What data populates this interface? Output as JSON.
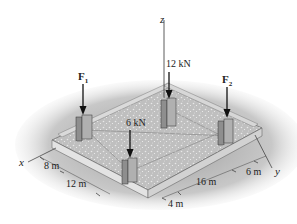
{
  "figure": {
    "axes": {
      "x": "x",
      "y": "y",
      "z": "z"
    },
    "loads": {
      "f1": {
        "label": "F",
        "sub": "1"
      },
      "f2": {
        "label": "F",
        "sub": "2"
      },
      "load_12": "12 kN",
      "load_6": "6 kN"
    },
    "dimensions": {
      "d8": "8 m",
      "d12": "12 m",
      "d4": "4 m",
      "d16": "16 m",
      "d6": "6 m"
    },
    "colors": {
      "slab_top": "#c9c9c9",
      "slab_edge": "#e6e6e6",
      "shadow": "#b5b5b5",
      "column": "#9a9a9a",
      "line": "#333333"
    }
  }
}
